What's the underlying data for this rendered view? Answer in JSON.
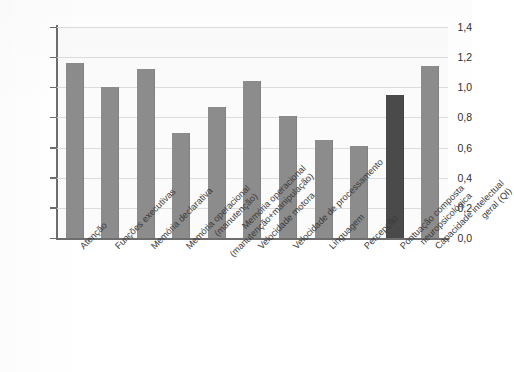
{
  "chart_data": {
    "type": "bar",
    "title": "",
    "subtitle": "",
    "xlabel": "",
    "ylabel": "Prejuízo médio",
    "ylim": [
      0.0,
      1.4
    ],
    "ytick_step": 0.2,
    "grid": true,
    "legend": false,
    "legend_position": "none",
    "decimal_separator": ",",
    "categories": [
      "Atenção",
      "Funções executivas",
      "Memória declarativa",
      "Memória operacional (manutenção)",
      "Memória operacional (manutenção+manipulação)",
      "Velocidade motora",
      "Velocidade de processamento",
      "Linguagem",
      "Percepção",
      "Pontuação composta neuropsicológica",
      "Capacidade intelectual geral (QI)"
    ],
    "values": [
      1.16,
      1.0,
      1.12,
      0.7,
      0.87,
      1.04,
      0.81,
      0.65,
      0.61,
      0.95,
      1.14
    ],
    "ytick_labels": [
      "0,0",
      "0,2",
      "0,4",
      "0,6",
      "0,8",
      "1,0",
      "1,2",
      "1,4"
    ],
    "ytick_values": [
      0.0,
      0.2,
      0.4,
      0.6,
      0.8,
      1.0,
      1.2,
      1.4
    ],
    "bar_colors": [
      "#8c8c8c",
      "#8c8c8c",
      "#8c8c8c",
      "#8c8c8c",
      "#8c8c8c",
      "#8c8c8c",
      "#8c8c8c",
      "#8c8c8c",
      "#8c8c8c",
      "#4a4a4a",
      "#8c8c8c"
    ],
    "highlight_index": 9,
    "colors": {
      "bar_default": "#8c8c8c",
      "bar_highlight": "#4a4a4a",
      "axis": "#6d6d6d",
      "grid": "#dcdcdc",
      "plot_background": "#fbfbfb",
      "text": "#2f2f2f"
    },
    "category_label_lines": [
      [
        "Atenção"
      ],
      [
        "Funções executivas"
      ],
      [
        "Memória declarativa"
      ],
      [
        "Memória operacional",
        "(manutenção)"
      ],
      [
        "Memória operacional",
        "(manutenção+manipulação)"
      ],
      [
        "Velocidade motora"
      ],
      [
        "Velocidade de processamento"
      ],
      [
        "Linguagem"
      ],
      [
        "Percepção"
      ],
      [
        "Pontuação composta",
        "neuropsicológica"
      ],
      [
        "Capacidade intelectual",
        "geral (QI)"
      ]
    ]
  }
}
